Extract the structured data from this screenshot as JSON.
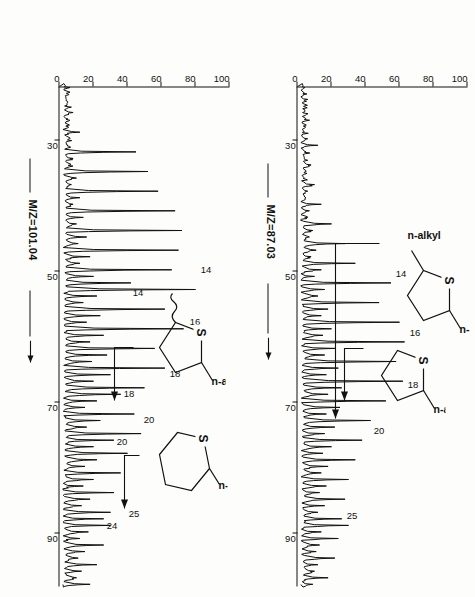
{
  "figure": {
    "kind": "gc-ms-mass-chromatograms",
    "orientation_note": "page scanned sideways; labels read bottom-to-top",
    "panels": [
      {
        "id": "panel-top",
        "ylabel": "M/Z=87.03",
        "yaxis": {
          "ticks": [
            100,
            80,
            60,
            40,
            20,
            0
          ],
          "min": 0,
          "max": 100,
          "unit": "relative intensity (%)"
        },
        "xaxis": {
          "ticks": [
            30,
            50,
            70,
            90
          ],
          "min": 22,
          "max": 98,
          "unit": "retention time (min)"
        },
        "peak_labels": [
          "14",
          "16",
          "18",
          "20",
          "25"
        ],
        "structures": [
          {
            "name": "2,5-di-n-alkyl-thiolane",
            "left_label": "n-alkyl",
            "right_label": "n-alkyl",
            "hetero": "S",
            "ring": 5
          },
          {
            "name": "2-n-alkyl-thiolane",
            "right_label": "n-alkyl",
            "hetero": "S",
            "ring": 5
          }
        ],
        "chart_data": {
          "type": "line",
          "title": "M/Z=87.03 mass chromatogram",
          "xlabel": "retention time (min)",
          "ylabel": "relative intensity (%)",
          "xlim": [
            22,
            98
          ],
          "ylim": [
            0,
            100
          ],
          "grid": false,
          "labelled_peaks": [
            {
              "label": "14",
              "x": 52.5,
              "y": 55
            },
            {
              "label": "16",
              "x": 61.5,
              "y": 63
            },
            {
              "label": "18",
              "x": 69.5,
              "y": 62
            },
            {
              "label": "20",
              "x": 76.5,
              "y": 43
            },
            {
              "label": "25",
              "x": 89.5,
              "y": 30
            }
          ],
          "series": [
            {
              "name": "m/z 87.03",
              "x": [
                22,
                23,
                24,
                25,
                26,
                27,
                28,
                29,
                30,
                31,
                32,
                33,
                34,
                35,
                36,
                37,
                38,
                39,
                40,
                41,
                42,
                43,
                44,
                45,
                46,
                47,
                48,
                49,
                50,
                51,
                52,
                53,
                54,
                55,
                56,
                57,
                58,
                59,
                60,
                61,
                62,
                63,
                64,
                65,
                66,
                67,
                68,
                69,
                70,
                71,
                72,
                73,
                74,
                75,
                76,
                77,
                78,
                79,
                80,
                81,
                82,
                83,
                84,
                85,
                86,
                87,
                88,
                89,
                90,
                91,
                92,
                93,
                94,
                95,
                96,
                97,
                98
              ],
              "y": [
                3,
                4,
                6,
                4,
                3,
                5,
                4,
                3,
                6,
                12,
                5,
                4,
                8,
                5,
                4,
                10,
                6,
                5,
                14,
                7,
                6,
                20,
                9,
                7,
                28,
                11,
                8,
                34,
                14,
                10,
                55,
                16,
                12,
                48,
                18,
                14,
                60,
                20,
                15,
                63,
                22,
                16,
                58,
                24,
                17,
                62,
                26,
                18,
                52,
                25,
                17,
                43,
                22,
                16,
                38,
                20,
                15,
                34,
                18,
                14,
                30,
                17,
                13,
                28,
                16,
                12,
                26,
                30,
                14,
                24,
                13,
                11,
                22,
                12,
                10,
                18,
                9
              ]
            }
          ]
        }
      },
      {
        "id": "panel-bottom",
        "ylabel": "M/Z=101.04",
        "yaxis": {
          "ticks": [
            100,
            80,
            60,
            40,
            20,
            0
          ],
          "min": 0,
          "max": 100,
          "unit": "relative intensity (%)"
        },
        "xaxis": {
          "ticks": [
            30,
            50,
            70,
            90
          ],
          "min": 22,
          "max": 98,
          "unit": "retention time (min)"
        },
        "peak_labels": [
          "14",
          "16",
          "18",
          "20",
          "14",
          "18",
          "20",
          "24",
          "25"
        ],
        "structures": [
          {
            "name": "2-methyl-5-n-alkyl-thiolane",
            "right_label": "n-alkyl",
            "hetero": "S",
            "ring": 5
          },
          {
            "name": "2-n-alkyl-thiane",
            "right_label": "n-alkyl",
            "hetero": "S",
            "ring": 6
          }
        ],
        "chart_data": {
          "type": "line",
          "title": "M/Z=101.04 mass chromatogram",
          "xlabel": "retention time (min)",
          "ylabel": "relative intensity (%)",
          "xlim": [
            22,
            98
          ],
          "ylim": [
            0,
            100
          ],
          "grid": false,
          "labelled_peaks": [
            {
              "label": "14",
              "x": 52.5,
              "y": 80
            },
            {
              "label": "16",
              "x": 60.5,
              "y": 73
            },
            {
              "label": "18",
              "x": 68.5,
              "y": 62
            },
            {
              "label": "20",
              "x": 75.5,
              "y": 48
            },
            {
              "label": "14",
              "x": 54.5,
              "y": 42
            },
            {
              "label": "18",
              "x": 70.0,
              "y": 36
            },
            {
              "label": "20",
              "x": 77.5,
              "y": 32
            },
            {
              "label": "24",
              "x": 88.5,
              "y": 26
            },
            {
              "label": "25",
              "x": 90.5,
              "y": 30
            }
          ],
          "series": [
            {
              "name": "m/z 101.04",
              "x": [
                22,
                23,
                24,
                25,
                26,
                27,
                28,
                29,
                30,
                31,
                32,
                33,
                34,
                35,
                36,
                37,
                38,
                39,
                40,
                41,
                42,
                43,
                44,
                45,
                46,
                47,
                48,
                49,
                50,
                51,
                52,
                53,
                54,
                55,
                56,
                57,
                58,
                59,
                60,
                61,
                62,
                63,
                64,
                65,
                66,
                67,
                68,
                69,
                70,
                71,
                72,
                73,
                74,
                75,
                76,
                77,
                78,
                79,
                80,
                81,
                82,
                83,
                84,
                85,
                86,
                87,
                88,
                89,
                90,
                91,
                92,
                93,
                94,
                95,
                96,
                97,
                98
              ],
              "y": [
                3,
                5,
                4,
                3,
                8,
                5,
                4,
                12,
                6,
                5,
                45,
                8,
                6,
                52,
                10,
                7,
                58,
                12,
                8,
                68,
                14,
                10,
                72,
                16,
                11,
                70,
                18,
                12,
                66,
                20,
                42,
                80,
                22,
                14,
                62,
                24,
                16,
                73,
                26,
                18,
                56,
                28,
                19,
                62,
                30,
                20,
                50,
                36,
                22,
                15,
                44,
                24,
                16,
                48,
                32,
                20,
                40,
                22,
                15,
                36,
                20,
                14,
                32,
                18,
                13,
                30,
                26,
                30,
                17,
                12,
                26,
                15,
                11,
                22,
                13,
                10,
                18
              ]
            }
          ]
        }
      }
    ]
  }
}
